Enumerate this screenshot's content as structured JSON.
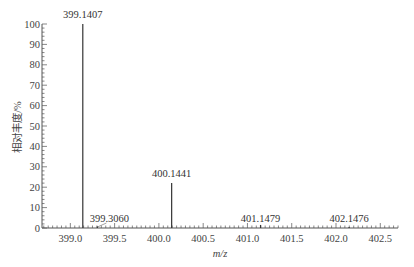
{
  "chart_data": {
    "type": "bar",
    "subtype": "mass-spectrum-stick",
    "title": "",
    "xlabel": "m/z",
    "ylabel": "相对丰度/%",
    "xlim": [
      398.68,
      402.7
    ],
    "ylim": [
      0,
      100
    ],
    "x_ticks": [
      399.0,
      399.5,
      400.0,
      400.5,
      401.0,
      401.5,
      402.0,
      402.5
    ],
    "x_tick_labels": [
      "399.0",
      "399.5",
      "400.0",
      "400.5",
      "401.0",
      "401.5",
      "402.0",
      "402.5"
    ],
    "y_ticks": [
      0,
      10,
      20,
      30,
      40,
      50,
      60,
      70,
      80,
      90,
      100
    ],
    "y_tick_labels": [
      "0",
      "10",
      "20",
      "30",
      "40",
      "50",
      "60",
      "70",
      "80",
      "90",
      "100"
    ],
    "grid": false,
    "legend": null,
    "peaks": [
      {
        "mz": 399.1407,
        "intensity": 100,
        "label": "399.1407"
      },
      {
        "mz": 399.306,
        "intensity": 0.8,
        "label": "399.3060"
      },
      {
        "mz": 400.1441,
        "intensity": 22,
        "label": "400.1441"
      },
      {
        "mz": 401.1479,
        "intensity": 1.5,
        "label": "401.1479"
      },
      {
        "mz": 402.1476,
        "intensity": 0.5,
        "label": "402.1476"
      }
    ]
  }
}
